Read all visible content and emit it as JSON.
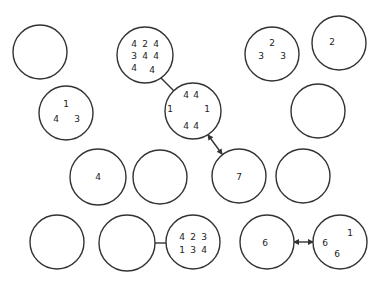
{
  "diagram": {
    "background": "#ffffff",
    "stroke_color": "#333333",
    "text_color": "#222222",
    "circles": [
      {
        "id": "c1",
        "cx": 40,
        "cy": 52,
        "r": 27,
        "labels": []
      },
      {
        "id": "c2",
        "cx": 66,
        "cy": 113,
        "r": 27,
        "labels": [
          {
            "t": "1",
            "x": 66,
            "y": 104
          },
          {
            "t": "4",
            "x": 56,
            "y": 119
          },
          {
            "t": "3",
            "x": 77,
            "y": 119
          }
        ]
      },
      {
        "id": "c3",
        "cx": 145,
        "cy": 55,
        "r": 28,
        "labels": [
          {
            "t": "4",
            "x": 134,
            "y": 44
          },
          {
            "t": "2",
            "x": 145,
            "y": 44
          },
          {
            "t": "4",
            "x": 156,
            "y": 44
          },
          {
            "t": "3",
            "x": 134,
            "y": 56
          },
          {
            "t": "4",
            "x": 145,
            "y": 56
          },
          {
            "t": "4",
            "x": 156,
            "y": 56
          },
          {
            "t": "4",
            "x": 134,
            "y": 68
          },
          {
            "t": "4",
            "x": 152,
            "y": 70
          }
        ]
      },
      {
        "id": "c4",
        "cx": 193,
        "cy": 111,
        "r": 28,
        "labels": [
          {
            "t": "4",
            "x": 186,
            "y": 95
          },
          {
            "t": "4",
            "x": 196,
            "y": 95
          },
          {
            "t": "1",
            "x": 170,
            "y": 109
          },
          {
            "t": "1",
            "x": 207,
            "y": 109
          },
          {
            "t": "4",
            "x": 186,
            "y": 126
          },
          {
            "t": "4",
            "x": 196,
            "y": 126
          }
        ]
      },
      {
        "id": "c5",
        "cx": 272,
        "cy": 54,
        "r": 27,
        "labels": [
          {
            "t": "2",
            "x": 272,
            "y": 43
          },
          {
            "t": "3",
            "x": 261,
            "y": 56
          },
          {
            "t": "3",
            "x": 283,
            "y": 56
          }
        ]
      },
      {
        "id": "c6",
        "cx": 339,
        "cy": 43,
        "r": 27,
        "labels": [
          {
            "t": "2",
            "x": 332,
            "y": 42
          }
        ]
      },
      {
        "id": "c7",
        "cx": 318,
        "cy": 111,
        "r": 27,
        "labels": []
      },
      {
        "id": "c8",
        "cx": 98,
        "cy": 177,
        "r": 28,
        "labels": [
          {
            "t": "4",
            "x": 98,
            "y": 177
          }
        ]
      },
      {
        "id": "c9",
        "cx": 160,
        "cy": 177,
        "r": 27,
        "labels": []
      },
      {
        "id": "c10",
        "cx": 239,
        "cy": 176,
        "r": 27,
        "labels": [
          {
            "t": "7",
            "x": 239,
            "y": 177
          }
        ]
      },
      {
        "id": "c11",
        "cx": 303,
        "cy": 176,
        "r": 27,
        "labels": []
      },
      {
        "id": "c12",
        "cx": 57,
        "cy": 242,
        "r": 27,
        "labels": []
      },
      {
        "id": "c13",
        "cx": 127,
        "cy": 243,
        "r": 28,
        "labels": []
      },
      {
        "id": "c14",
        "cx": 193,
        "cy": 242,
        "r": 27,
        "labels": [
          {
            "t": "4",
            "x": 182,
            "y": 237
          },
          {
            "t": "2",
            "x": 193,
            "y": 237
          },
          {
            "t": "3",
            "x": 204,
            "y": 237
          },
          {
            "t": "1",
            "x": 182,
            "y": 250
          },
          {
            "t": "3",
            "x": 193,
            "y": 250
          },
          {
            "t": "4",
            "x": 204,
            "y": 250
          }
        ]
      },
      {
        "id": "c15",
        "cx": 267,
        "cy": 242,
        "r": 27,
        "labels": [
          {
            "t": "6",
            "x": 265,
            "y": 243
          }
        ]
      },
      {
        "id": "c16",
        "cx": 340,
        "cy": 242,
        "r": 27,
        "labels": [
          {
            "t": "1",
            "x": 350,
            "y": 233
          },
          {
            "t": "6",
            "x": 325,
            "y": 243
          },
          {
            "t": "6",
            "x": 337,
            "y": 254
          }
        ]
      }
    ],
    "connections": [
      {
        "from": "c3",
        "to": "c4",
        "type": "line",
        "x1": 161,
        "y1": 78,
        "x2": 174,
        "y2": 91
      },
      {
        "from": "c4",
        "to": "c10",
        "type": "double-arrow",
        "x1": 208,
        "y1": 135,
        "x2": 222,
        "y2": 154
      },
      {
        "from": "c13",
        "to": "c14",
        "type": "line",
        "x1": 155,
        "y1": 243,
        "x2": 166,
        "y2": 243
      },
      {
        "from": "c15",
        "to": "c16",
        "type": "double-arrow",
        "x1": 294,
        "y1": 242,
        "x2": 313,
        "y2": 242
      }
    ]
  }
}
